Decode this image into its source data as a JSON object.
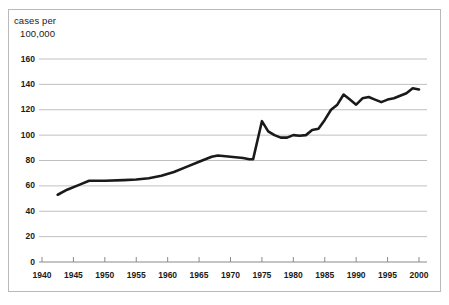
{
  "chart_data": {
    "type": "line",
    "title": "",
    "subtitle": "",
    "xlabel": "",
    "ylabel": "cases per 100,000",
    "ylabel_line1": "cases per",
    "ylabel_line2": "100,000",
    "xlim": [
      1940,
      2000
    ],
    "ylim": [
      0,
      160
    ],
    "grid": "horizontal",
    "legend": "none",
    "line_color": "#1a1a1a",
    "grid_color": "#b0b0b0",
    "axis_color": "#8a8a8a",
    "background": "#ffffff",
    "border_color": "#b9b9b9",
    "yticks": [
      0,
      20,
      40,
      60,
      80,
      100,
      120,
      140,
      160
    ],
    "ytick_labels": [
      "0",
      "20",
      "40",
      "60",
      "80",
      "100",
      "120",
      "140",
      "160"
    ],
    "xticks": [
      1940,
      1945,
      1950,
      1955,
      1960,
      1965,
      1970,
      1975,
      1980,
      1985,
      1990,
      1995,
      2000
    ],
    "xtick_labels": [
      "1940",
      "1945",
      "1950",
      "1955",
      "1960",
      "1965",
      "1970",
      "1975",
      "1980",
      "1985",
      "1990",
      "1995",
      "2000"
    ],
    "series": [
      {
        "name": "cases per 100,000",
        "x": [
          1942.5,
          1944,
          1946,
          1947.5,
          1950,
          1953,
          1955,
          1957,
          1959,
          1961,
          1963,
          1965,
          1967,
          1968,
          1970,
          1972,
          1973,
          1973.6,
          1975,
          1976,
          1977,
          1978,
          1979,
          1980,
          1981,
          1982,
          1983,
          1984,
          1985,
          1986,
          1987,
          1988,
          1989,
          1990,
          1991,
          1992,
          1993,
          1994,
          1995,
          1996,
          1997,
          1998,
          1999,
          2000
        ],
        "values": [
          53,
          57,
          61,
          64,
          64,
          64.5,
          65,
          66,
          68,
          71,
          75,
          79,
          83,
          84,
          83,
          82,
          81,
          81,
          111,
          103,
          100,
          98,
          98,
          100,
          99.5,
          100,
          104,
          105,
          112,
          120,
          124,
          132,
          128,
          124,
          129,
          130,
          128,
          126,
          128,
          129,
          131,
          133,
          137,
          136
        ]
      }
    ]
  }
}
